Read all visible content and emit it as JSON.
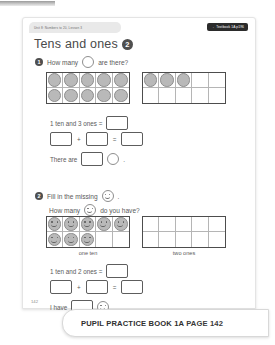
{
  "header": {
    "unit_tab": "Unit 8: Numbers to 20, Lesson 3",
    "textbook_badge_arrow": "→",
    "textbook_badge": "Textbook 1A p196",
    "title": "Tens and ones",
    "title_badge": "2"
  },
  "question1": {
    "number": "1",
    "prompt_before": "How many",
    "prompt_after": "are there?",
    "counter_icon": "circle-counter-icon",
    "frames": [
      {
        "name": "ten-frame-full",
        "filled": 10,
        "total": 10
      },
      {
        "name": "ten-frame-ones",
        "filled": 3,
        "total": 10
      }
    ],
    "line1_text": "1 ten and 3 ones =",
    "line2_plus": "+",
    "line2_equals": "=",
    "line3_before": "There are",
    "line3_after": ".",
    "answers": {
      "a1": "",
      "a2": "",
      "a3": "",
      "a4": "",
      "a5": ""
    }
  },
  "question2": {
    "number": "2",
    "prompt1_before": "Fill in the missing",
    "prompt1_after": ".",
    "prompt2_before": "How many",
    "prompt2_after": "do you have?",
    "smiley_icon": "smiley-face-icon",
    "frames": [
      {
        "name": "ten-frame-faces",
        "filled": 8,
        "total": 10,
        "label": "one ten"
      },
      {
        "name": "ten-frame-empty",
        "filled": 0,
        "total": 10,
        "label": "two ones"
      }
    ],
    "label_left": "one ten",
    "label_right": "two ones",
    "line1_text": "1 ten and 2 ones =",
    "line2_plus": "+",
    "line2_equals": "=",
    "line3_before": "I have",
    "line3_after": ".",
    "answers": {
      "b1": "",
      "b2": "",
      "b3": "",
      "b4": "",
      "b5": ""
    }
  },
  "page_number": "142",
  "footer": {
    "book_label": "PUPIL PRACTICE BOOK 1A",
    "page_label": "PAGE 142"
  },
  "colors": {
    "badge_dark": "#2b2b2b",
    "counter_fill": "#b9b9b9",
    "frame_border": "#4d4d4d",
    "text": "#5a5a5a"
  }
}
